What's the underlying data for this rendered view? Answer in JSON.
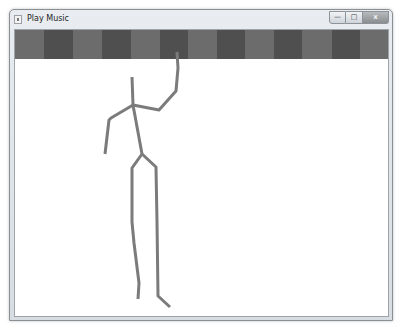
{
  "window": {
    "title": "Play Music",
    "icon": "app-icon",
    "caption_buttons": {
      "minimize": {
        "icon": "minimize-icon",
        "glyph": "—"
      },
      "maximize": {
        "icon": "maximize-icon",
        "glyph": "□"
      },
      "close": {
        "icon": "close-icon",
        "glyph": "x"
      }
    }
  },
  "banner": {
    "colors": {
      "light": "#6c6c6c",
      "dark": "#4f4f4f"
    },
    "blocks": [
      {
        "shade": "light",
        "width": 29
      },
      {
        "shade": "dark",
        "width": 29
      },
      {
        "shade": "light",
        "width": 29
      },
      {
        "shade": "dark",
        "width": 29
      },
      {
        "shade": "light",
        "width": 29
      },
      {
        "shade": "dark",
        "width": 28
      },
      {
        "shade": "light",
        "width": 29
      },
      {
        "shade": "dark",
        "width": 28
      },
      {
        "shade": "light",
        "width": 29
      },
      {
        "shade": "dark",
        "width": 28
      },
      {
        "shade": "light",
        "width": 30
      },
      {
        "shade": "dark",
        "width": 28
      },
      {
        "shade": "light",
        "width": 30
      }
    ]
  },
  "figure": {
    "stroke_color": "#7b7b7b",
    "stroke_width": 3,
    "segments": [
      {
        "name": "neck",
        "points": [
          [
            117,
            47
          ],
          [
            118,
            75
          ]
        ]
      },
      {
        "name": "spine",
        "points": [
          [
            118,
            75
          ],
          [
            127,
            124
          ]
        ]
      },
      {
        "name": "right-arm",
        "points": [
          [
            118,
            75
          ],
          [
            144,
            80
          ],
          [
            161,
            61
          ],
          [
            163,
            38
          ],
          [
            162,
            22
          ]
        ]
      },
      {
        "name": "left-arm",
        "points": [
          [
            118,
            75
          ],
          [
            96,
            88
          ],
          [
            94,
            90
          ],
          [
            90,
            124
          ]
        ]
      },
      {
        "name": "left-leg",
        "points": [
          [
            127,
            124
          ],
          [
            117,
            138
          ],
          [
            117,
            192
          ],
          [
            119,
            213
          ],
          [
            124,
            253
          ],
          [
            123,
            269
          ]
        ]
      },
      {
        "name": "right-leg",
        "points": [
          [
            127,
            124
          ],
          [
            141,
            137
          ],
          [
            142,
            192
          ],
          [
            143,
            266
          ],
          [
            155,
            277
          ]
        ]
      }
    ]
  }
}
